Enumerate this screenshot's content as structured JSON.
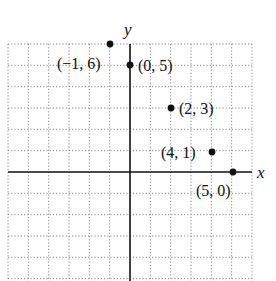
{
  "diagram": {
    "type": "coordinate-plane",
    "axes": {
      "x_label": "x",
      "y_label": "y"
    },
    "grid": {
      "x_min": -6,
      "x_max": 6,
      "y_min": -5,
      "y_max": 6,
      "style": "dotted"
    },
    "points": [
      {
        "x": -1,
        "y": 6,
        "label": "(−1, 6)"
      },
      {
        "x": 0,
        "y": 5,
        "label": "(0, 5)"
      },
      {
        "x": 2,
        "y": 3,
        "label": "(2, 3)"
      },
      {
        "x": 4,
        "y": 1,
        "label": "(4, 1)"
      },
      {
        "x": 5,
        "y": 0,
        "label": "(5, 0)"
      }
    ]
  }
}
